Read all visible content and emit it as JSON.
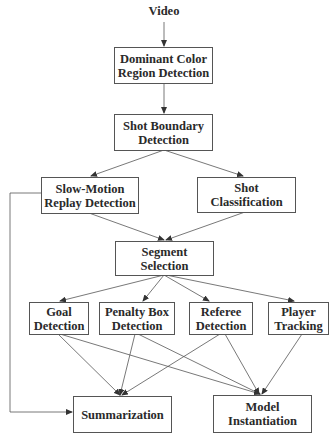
{
  "diagram": {
    "type": "flowchart",
    "input": {
      "id": "video",
      "label": "Video"
    },
    "nodes": [
      {
        "id": "dominant-color",
        "label": "Dominant Color\nRegion Detection"
      },
      {
        "id": "shot-boundary",
        "label": "Shot Boundary\nDetection"
      },
      {
        "id": "slow-motion",
        "label": "Slow-Motion\nReplay Detection"
      },
      {
        "id": "shot-classification",
        "label": "Shot\nClassification"
      },
      {
        "id": "segment-selection",
        "label": "Segment\nSelection"
      },
      {
        "id": "goal-detection",
        "label": "Goal\nDetection"
      },
      {
        "id": "penalty-box",
        "label": "Penalty Box\nDetection"
      },
      {
        "id": "referee-detection",
        "label": "Referee\nDetection"
      },
      {
        "id": "player-tracking",
        "label": "Player\nTracking"
      },
      {
        "id": "summarization",
        "label": "Summarization"
      },
      {
        "id": "model-instantiation",
        "label": "Model\nInstantiation"
      }
    ],
    "edges": [
      [
        "video",
        "dominant-color"
      ],
      [
        "dominant-color",
        "shot-boundary"
      ],
      [
        "shot-boundary",
        "slow-motion"
      ],
      [
        "shot-boundary",
        "shot-classification"
      ],
      [
        "slow-motion",
        "segment-selection"
      ],
      [
        "shot-classification",
        "segment-selection"
      ],
      [
        "segment-selection",
        "goal-detection"
      ],
      [
        "segment-selection",
        "penalty-box"
      ],
      [
        "segment-selection",
        "referee-detection"
      ],
      [
        "segment-selection",
        "player-tracking"
      ],
      [
        "goal-detection",
        "summarization"
      ],
      [
        "goal-detection",
        "model-instantiation"
      ],
      [
        "penalty-box",
        "summarization"
      ],
      [
        "penalty-box",
        "model-instantiation"
      ],
      [
        "referee-detection",
        "summarization"
      ],
      [
        "referee-detection",
        "model-instantiation"
      ],
      [
        "player-tracking",
        "model-instantiation"
      ],
      [
        "slow-motion",
        "summarization"
      ]
    ]
  }
}
